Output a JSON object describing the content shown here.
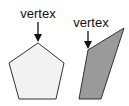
{
  "figures": [
    {
      "shape": "pentagon",
      "label": "vertex",
      "fill": "#f2f2f2",
      "stroke": "#333333"
    },
    {
      "shape": "quadrilateral",
      "label": "vertex",
      "fill": "#9a9a9a",
      "stroke": "#333333"
    }
  ]
}
